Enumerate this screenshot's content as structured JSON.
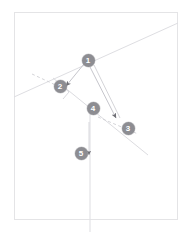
{
  "figure": {
    "background_color": "#ffffff",
    "frame_color": "#e2e2e4",
    "line_color": "#d8d8dc",
    "accent_line_color": "#c9c9ce",
    "marker_fill": "#8d8d92",
    "marker_text_color": "#ffffff",
    "width": 191,
    "height": 232
  },
  "frame": {
    "name": "figure-border",
    "x": 14,
    "y": 12,
    "width": 164,
    "height": 208
  },
  "markers": [
    {
      "id": "1",
      "label": "1",
      "x": 88,
      "y": 60,
      "name": "marker-1"
    },
    {
      "id": "2",
      "label": "2",
      "x": 60,
      "y": 86,
      "name": "marker-2"
    },
    {
      "id": "3",
      "label": "3",
      "x": 128,
      "y": 128,
      "name": "marker-3"
    },
    {
      "id": "4",
      "label": "4",
      "x": 93,
      "y": 108,
      "name": "marker-4"
    },
    {
      "id": "5",
      "label": "5",
      "x": 81,
      "y": 153,
      "name": "marker-5"
    }
  ],
  "lines": [
    {
      "name": "primary-diagonal-line",
      "style": "solid",
      "x1": 14,
      "y1": 97,
      "x2": 178,
      "y2": 23
    },
    {
      "name": "secondary-diagonal-line",
      "style": "solid",
      "x1": 53,
      "y1": 78,
      "x2": 148,
      "y2": 155
    },
    {
      "name": "dashed-guide-upper-left",
      "style": "dashed",
      "x1": 34,
      "y1": 75,
      "x2": 62,
      "y2": 88
    },
    {
      "name": "dashed-guide-lower-right",
      "style": "dashed",
      "x1": 98,
      "y1": 117,
      "x2": 137,
      "y2": 134
    },
    {
      "name": "leader-line-1-to-2",
      "style": "solid",
      "x1": 87,
      "y1": 66,
      "x2": 62,
      "y2": 87
    },
    {
      "name": "leader-line-1-to-3-a",
      "style": "solid",
      "x1": 90,
      "y1": 66,
      "x2": 118,
      "y2": 120
    },
    {
      "name": "leader-line-1-to-3-b",
      "style": "solid",
      "x1": 93,
      "y1": 65,
      "x2": 120,
      "y2": 119
    },
    {
      "name": "vertical-drop-line",
      "style": "solid",
      "x1": 90,
      "y1": 113,
      "x2": 90,
      "y2": 232
    },
    {
      "name": "short-vertical-line",
      "style": "solid",
      "x1": 88,
      "y1": 122,
      "x2": 88,
      "y2": 160
    }
  ],
  "arrows": [
    {
      "name": "arrow-to-marker-3",
      "tip_x": 119,
      "tip_y": 121,
      "angle_deg": 63
    },
    {
      "name": "arrow-to-marker-2",
      "tip_x": 64,
      "tip_y": 88,
      "angle_deg": 200
    },
    {
      "name": "arrow-downward-at-marker-5",
      "tip_x": 89,
      "tip_y": 158,
      "angle_deg": 90
    }
  ],
  "angle_marks": [
    {
      "name": "right-angle-mark-at-marker-2",
      "x": 63,
      "y": 89,
      "size": 9
    }
  ],
  "annotations": {
    "count": 5,
    "marker_labels": [
      "1",
      "2",
      "3",
      "4",
      "5"
    ]
  }
}
